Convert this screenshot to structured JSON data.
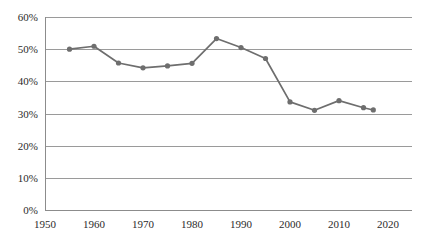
{
  "chart_data": {
    "type": "line",
    "title": "",
    "subtitle": "",
    "xlabel": "",
    "ylabel": "",
    "xlim": [
      1950,
      2020
    ],
    "ylim": [
      0,
      60
    ],
    "grid": "horizontal",
    "legend": "none",
    "x_tick_labels": [
      "1950",
      "1960",
      "1970",
      "1980",
      "1990",
      "2000",
      "2010",
      "2020"
    ],
    "x_ticks": [
      1950,
      1960,
      1970,
      1980,
      1990,
      2000,
      2010,
      2020
    ],
    "y_tick_labels": [
      "0%",
      "10%",
      "20%",
      "30%",
      "40%",
      "50%",
      "60%"
    ],
    "y_ticks": [
      0,
      10,
      20,
      30,
      40,
      50,
      60
    ],
    "series": [
      {
        "name": "series-1",
        "color": "#6e6e6e",
        "marker": "circle",
        "x": [
          1955,
          1960,
          1965,
          1970,
          1975,
          1980,
          1985,
          1990,
          1995,
          2000,
          2005,
          2010,
          2015,
          2017
        ],
        "values": [
          50.0,
          50.9,
          45.7,
          44.2,
          44.8,
          45.6,
          53.3,
          50.5,
          47.1,
          33.6,
          31.0,
          34.0,
          31.8,
          31.1
        ]
      }
    ]
  },
  "colors": {
    "series": "#6e6e6e",
    "gridline": "#9a9a9a",
    "axis": "#8c8c8c",
    "text": "#2b2b2b",
    "background": "#ffffff"
  }
}
